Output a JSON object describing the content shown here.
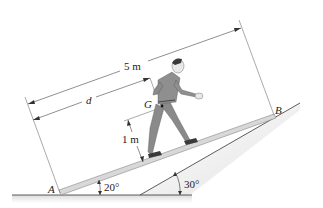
{
  "diagram": {
    "labels": {
      "point_a": "A",
      "point_b": "B",
      "center_of_gravity": "G",
      "total_length": "5 m",
      "distance_d": "d",
      "height_g": "1 m",
      "plank_angle": "20°",
      "incline_angle": "30°"
    },
    "colors": {
      "line": "#333333",
      "plank_fill": "#d8d8d8",
      "plank_edge": "#888888",
      "ground_shadow": "#e6e6e6",
      "figure_clothes": "#8a8a8a",
      "figure_skin": "#e8e8e8",
      "figure_hair": "#3a3a3a"
    }
  }
}
